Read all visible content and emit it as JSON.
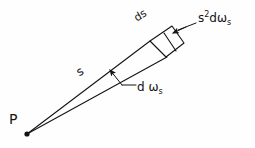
{
  "figure": {
    "width": 255,
    "height": 148,
    "background_color": "#fefefe",
    "stroke_color": "#141414"
  },
  "labels": {
    "apex_point": "P",
    "patch": "ds",
    "ray_length": "s",
    "projected_area": {
      "base": "s",
      "exponent": "2",
      "differential": "d",
      "symbol": "ω",
      "subscript": "s"
    },
    "solid_angle": {
      "differential": "d",
      "symbol": "ω",
      "subscript": "s"
    }
  },
  "geometry": {
    "apex": {
      "x": 27,
      "y": 134,
      "dot_radius": 2.6
    },
    "upper_ray": {
      "x1": 27,
      "y1": 134,
      "x2": 150,
      "y2": 41
    },
    "lower_ray": {
      "x1": 27,
      "y1": 134,
      "x2": 167,
      "y2": 57
    },
    "patch_quad": [
      {
        "x": 150,
        "y": 41
      },
      {
        "x": 172,
        "y": 26
      },
      {
        "x": 184,
        "y": 43
      },
      {
        "x": 166,
        "y": 57
      }
    ],
    "patch_divider": {
      "x1": 164,
      "y1": 33,
      "x2": 176,
      "y2": 51
    },
    "arrow_to_patch": {
      "tail": {
        "x": 196,
        "y": 23
      },
      "head": {
        "x": 174,
        "y": 32
      }
    },
    "arrow_to_solid_angle": {
      "tail": {
        "x": 136,
        "y": 85
      },
      "head": {
        "x": 108,
        "y": 68
      },
      "elbow": {
        "x": 124,
        "y": 85
      }
    }
  }
}
